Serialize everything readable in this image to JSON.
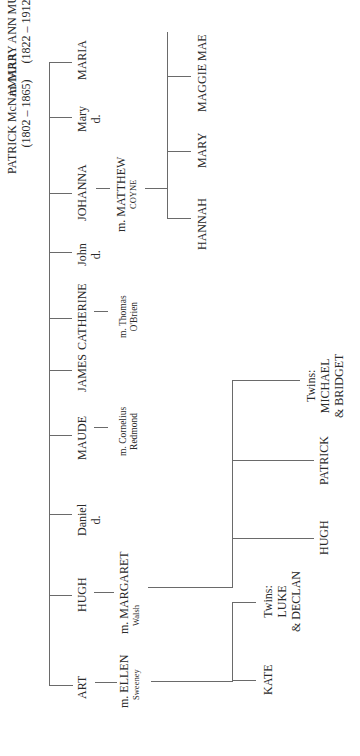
{
  "root": {
    "father": "PATRICK McNAMARA",
    "father_years": "(1802 – 1865)",
    "mother": "m. MARY ANN MURPHY",
    "mother_years": "(1822 – 1912)"
  },
  "children": [
    {
      "name": "MARIA"
    },
    {
      "name": "Mary",
      "note": "d."
    },
    {
      "name": "JOHANNA",
      "spouse": "m. MATTHEW",
      "spouse_surname": "COYNE",
      "children": [
        "HANNAH",
        "MARY",
        "MAGGIE MAE"
      ]
    },
    {
      "name": "John",
      "note": "d."
    },
    {
      "name": "CATHERINE",
      "spouse": "m. Thomas",
      "spouse_surname": "O'Brien"
    },
    {
      "name": "JAMES"
    },
    {
      "name": "MAUDE",
      "spouse": "m. Cornelius",
      "spouse_surname": "Redmond"
    },
    {
      "name": "Daniel",
      "note": "d."
    },
    {
      "name": "HUGH",
      "spouse": "m. MARGARET",
      "spouse_surname": "Walsh",
      "children": [
        "HUGH",
        "PATRICK",
        "Twins:",
        "MICHAEL",
        "& BRIDGET"
      ]
    },
    {
      "name": "ART",
      "spouse": "m. ELLEN",
      "spouse_surname": "Sweeney",
      "children": [
        "KATE",
        "Twins:",
        "LUKE",
        "& DECLAN"
      ]
    }
  ]
}
